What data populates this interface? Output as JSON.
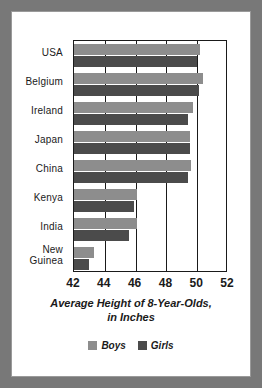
{
  "figure": {
    "frame_color": "#787878",
    "background": "#ffffff"
  },
  "legend": {
    "position": "bottom-center",
    "entries": [
      {
        "label": "Boys",
        "color": "#8d8d8d"
      },
      {
        "label": "Girls",
        "color": "#4b4b4b"
      }
    ]
  },
  "title": {
    "line1": "Average Height of 8-Year-Olds,",
    "line2": "in Inches"
  },
  "axis": {
    "ticks": [
      "42",
      "44",
      "46",
      "48",
      "50",
      "52"
    ]
  },
  "categories_display": [
    {
      "line1": "USA",
      "line2": ""
    },
    {
      "line1": "Belgium",
      "line2": ""
    },
    {
      "line1": "Ireland",
      "line2": ""
    },
    {
      "line1": "Japan",
      "line2": ""
    },
    {
      "line1": "China",
      "line2": ""
    },
    {
      "line1": "Kenya",
      "line2": ""
    },
    {
      "line1": "India",
      "line2": ""
    },
    {
      "line1": "New",
      "line2": "Guinea"
    }
  ],
  "chart_data": {
    "type": "bar",
    "orientation": "horizontal",
    "title": "Average Height of 8-Year-Olds, in Inches",
    "xlabel": "Average Height of 8-Year-Olds, in Inches",
    "ylabel": "",
    "xlim": [
      42,
      52
    ],
    "xticks": [
      42,
      44,
      46,
      48,
      50,
      52
    ],
    "grid": true,
    "legend": "bottom",
    "categories": [
      "USA",
      "Belgium",
      "Ireland",
      "Japan",
      "China",
      "Kenya",
      "India",
      "New Guinea"
    ],
    "series": [
      {
        "name": "Boys",
        "color": "#8d8d8d",
        "values": [
          50.2,
          50.4,
          49.7,
          49.5,
          49.6,
          46.1,
          46.1,
          43.3
        ]
      },
      {
        "name": "Girls",
        "color": "#4b4b4b",
        "values": [
          50.0,
          50.1,
          49.4,
          49.5,
          49.4,
          45.9,
          45.6,
          43.0
        ]
      }
    ]
  }
}
